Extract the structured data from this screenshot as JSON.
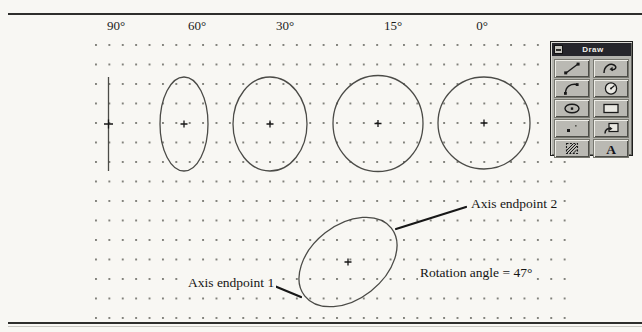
{
  "figure": {
    "title_labels": [
      "90°",
      "60°",
      "30°",
      "15°",
      "0°"
    ],
    "rotation_angles_deg": [
      90,
      60,
      30,
      15,
      0
    ],
    "example_rotation_deg": 47,
    "annotations": {
      "axis_endpoint_1": "Axis endpoint 1",
      "axis_endpoint_2": "Axis endpoint 2",
      "rotation_note": "Rotation angle = 47°"
    }
  },
  "toolbar": {
    "title": "Draw",
    "control_box": "minimize",
    "tools": [
      "line",
      "polyline",
      "arc",
      "circle",
      "ellipse",
      "rectangle",
      "point",
      "insert-block",
      "hatch",
      "text"
    ]
  },
  "colors": {
    "page_bg": "#f8f7f3",
    "ink": "#1c1c1c",
    "ellipse_stroke": "#4b4b47",
    "grid_dot": "#82827c",
    "toolbar_bg": "#b4b4ae",
    "titlebar_bg": "#26262b",
    "titlebar_text": "#efefe9"
  }
}
